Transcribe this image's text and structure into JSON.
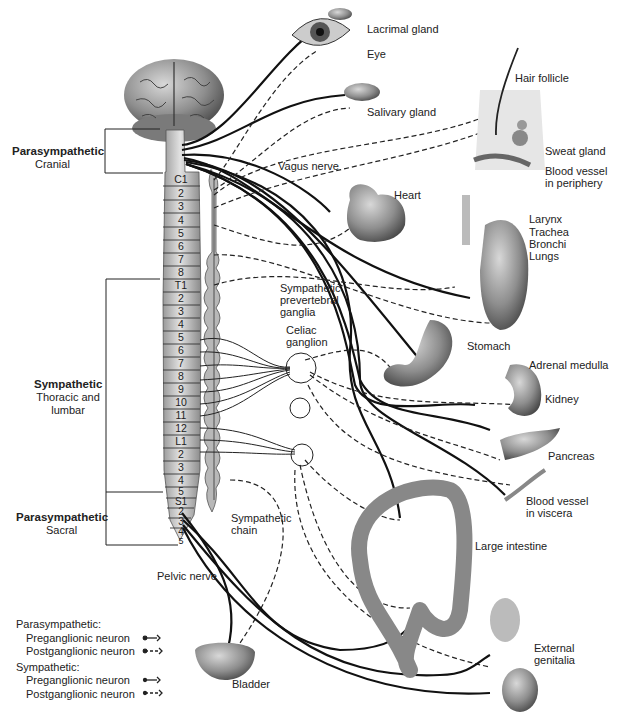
{
  "diagram": {
    "divisions": [
      {
        "name": "Parasympathetic",
        "subtitle": "Cranial"
      },
      {
        "name": "Sympathetic",
        "subtitle_line1": "Thoracic and",
        "subtitle_line2": "lumbar"
      },
      {
        "name": "Parasympathetic",
        "subtitle": "Sacral"
      }
    ],
    "spinal_segments": [
      "C1",
      "2",
      "3",
      "4",
      "5",
      "6",
      "7",
      "8",
      "T1",
      "2",
      "3",
      "4",
      "5",
      "6",
      "7",
      "8",
      "9",
      "10",
      "11",
      "12",
      "L1",
      "2",
      "3",
      "4",
      "5",
      "S1",
      "2",
      "3",
      "4",
      "5"
    ],
    "structures": {
      "vagus_nerve": "Vagus nerve",
      "prevertebral_line1": "Sympathetic",
      "prevertebral_line2": "prevertebral",
      "prevertebral_line3": "ganglia",
      "celiac_line1": "Celiac",
      "celiac_line2": "ganglion",
      "chain_line1": "Sympathetic",
      "chain_line2": "chain",
      "pelvic_nerve": "Pelvic nerve"
    },
    "organs": {
      "lacrimal": "Lacrimal gland",
      "eye": "Eye",
      "salivary": "Salivary gland",
      "hair": "Hair follicle",
      "sweat": "Sweat gland",
      "bv_periphery_1": "Blood vessel",
      "bv_periphery_2": "in periphery",
      "heart": "Heart",
      "larynx": "Larynx",
      "trachea": "Trachea",
      "bronchi": "Bronchi",
      "lungs": "Lungs",
      "stomach": "Stomach",
      "adrenal": "Adrenal medulla",
      "kidney": "Kidney",
      "pancreas": "Pancreas",
      "bv_viscera_1": "Blood vessel",
      "bv_viscera_2": "in viscera",
      "large_intestine": "Large intestine",
      "genitalia_1": "External",
      "genitalia_2": "genitalia",
      "bladder": "Bladder"
    },
    "legend": {
      "para_title": "Parasympathetic:",
      "para_pre": "Preganglionic neuron",
      "para_post": "Postganglionic neuron",
      "symp_title": "Sympathetic:",
      "symp_pre": "Preganglionic neuron",
      "symp_post": "Postganglionic neuron"
    },
    "colors": {
      "ink": "#1a1a1a",
      "organ_fill": "#9a9a9a",
      "cord_fill": "#c8c8c8"
    }
  }
}
